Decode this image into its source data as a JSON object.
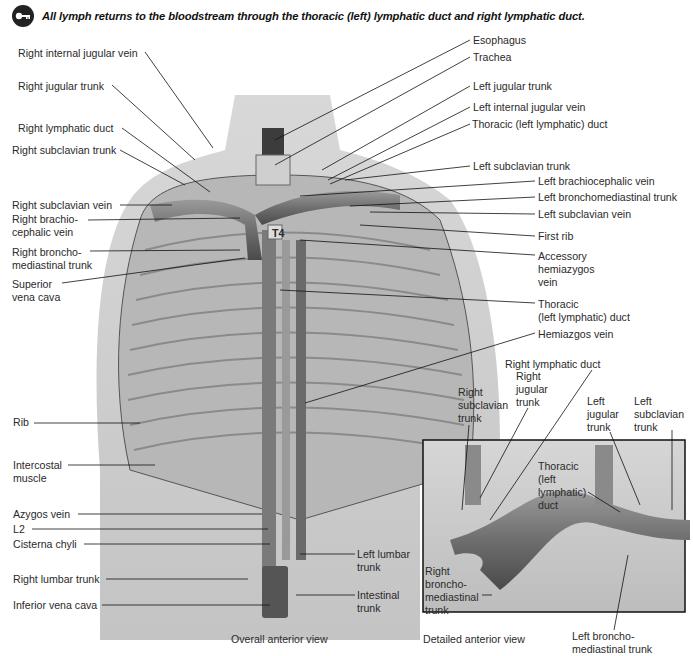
{
  "header": {
    "icon": "key-icon",
    "text": "All lymph returns to the bloodstream through the thoracic (left) lymphatic duct and right lymphatic duct."
  },
  "overall_view": {
    "caption": "Overall anterior view",
    "vertebra_label": "T4",
    "artist_signature": "Ellis",
    "left_labels": [
      {
        "id": "rijv",
        "text": "Right internal jugular vein"
      },
      {
        "id": "rjt",
        "text": "Right jugular trunk"
      },
      {
        "id": "rld",
        "text": "Right lymphatic duct"
      },
      {
        "id": "rst",
        "text": "Right subclavian trunk"
      },
      {
        "id": "rsv",
        "text": "Right subclavian vein"
      },
      {
        "id": "rbv",
        "text": "Right brachio-\ncephalic vein"
      },
      {
        "id": "rbmt",
        "text": "Right broncho-\nmediastinal trunk"
      },
      {
        "id": "svc",
        "text": "Superior\nvena cava"
      },
      {
        "id": "rib",
        "text": "Rib"
      },
      {
        "id": "icm",
        "text": "Intercostal\nmuscle"
      },
      {
        "id": "azv",
        "text": "Azygos vein"
      },
      {
        "id": "l2",
        "text": "L2"
      },
      {
        "id": "cc",
        "text": "Cisterna chyli"
      },
      {
        "id": "rlt",
        "text": "Right lumbar trunk"
      },
      {
        "id": "ivc",
        "text": "Inferior vena cava"
      }
    ],
    "right_labels": [
      {
        "id": "eso",
        "text": "Esophagus"
      },
      {
        "id": "tra",
        "text": "Trachea"
      },
      {
        "id": "ljt",
        "text": "Left jugular trunk"
      },
      {
        "id": "lijv",
        "text": "Left internal jugular vein"
      },
      {
        "id": "tld1",
        "text": "Thoracic (left lymphatic) duct"
      },
      {
        "id": "lst",
        "text": "Left subclavian trunk"
      },
      {
        "id": "lbv",
        "text": "Left brachiocephalic vein"
      },
      {
        "id": "lbmt",
        "text": "Left bronchomediastinal trunk"
      },
      {
        "id": "lsv",
        "text": "Left subclavian vein"
      },
      {
        "id": "fr",
        "text": "First rib"
      },
      {
        "id": "ahv",
        "text": "Accessory\nhemiazygos\nvein"
      },
      {
        "id": "tld2",
        "text": "Thoracic\n(left lymphatic) duct"
      },
      {
        "id": "hv",
        "text": "Hemiazgos vein"
      },
      {
        "id": "llt",
        "text": "Left lumbar\ntrunk"
      },
      {
        "id": "it",
        "text": "Intestinal\ntrunk"
      }
    ]
  },
  "detailed_view": {
    "caption": "Detailed anterior view",
    "labels": [
      {
        "id": "d_rld",
        "text": "Right lymphatic duct"
      },
      {
        "id": "d_rst",
        "text": "Right\nsubclavian\ntrunk"
      },
      {
        "id": "d_rjt",
        "text": "Right\njugular\ntrunk"
      },
      {
        "id": "d_ljt",
        "text": "Left\njugular\ntrunk"
      },
      {
        "id": "d_lst",
        "text": "Left\nsubclavian\ntrunk"
      },
      {
        "id": "d_tld",
        "text": "Thoracic\n(left\nlymphatic)\nduct"
      },
      {
        "id": "d_rbmt",
        "text": "Right\nbroncho-\nmediastinal\ntrunk"
      },
      {
        "id": "d_lbmt",
        "text": "Left broncho-\nmediastinal trunk"
      }
    ]
  }
}
